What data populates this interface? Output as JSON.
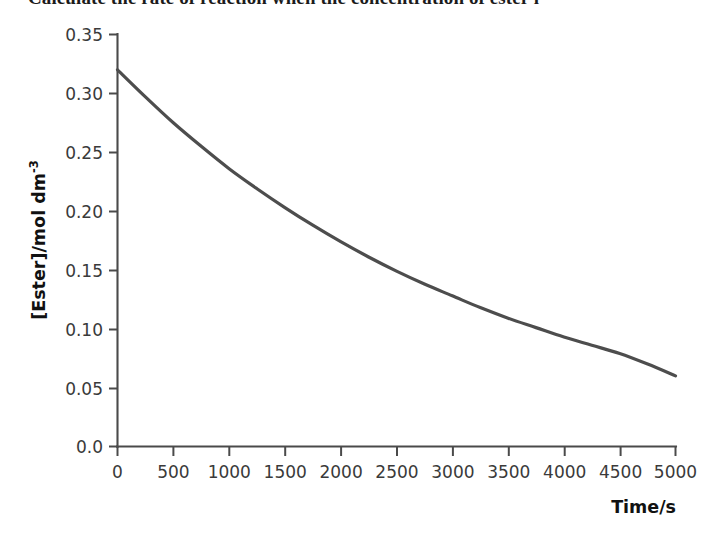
{
  "page": {
    "background_color": "#ffffff",
    "header_partial_text": "Calculate the rate of reaction when the concentration of ester i"
  },
  "chart_data": {
    "type": "line",
    "title": "",
    "subtitle": "",
    "xlabel": "Time/s",
    "ylabel": "[Ester]/mol dm⁻³",
    "ylabel_parts": {
      "base": "[Ester]/mol dm",
      "exponent": "-3"
    },
    "xlim": [
      0,
      5000
    ],
    "ylim": [
      0.0,
      0.35
    ],
    "grid": false,
    "legend": null,
    "legend_position": "none",
    "line_color": "#4d4d4d",
    "axis_color": "#4a4a4a",
    "xticks": [
      0,
      500,
      1000,
      1500,
      2000,
      2500,
      3000,
      3500,
      4000,
      4500,
      5000
    ],
    "xticklabels": [
      "0",
      "500",
      "1000",
      "1500",
      "2000",
      "2500",
      "3000",
      "3500",
      "4000",
      "4500",
      "5000"
    ],
    "yticks": [
      0.0,
      0.05,
      0.1,
      0.15,
      0.2,
      0.25,
      0.3,
      0.35
    ],
    "yticklabels": [
      "0.0",
      "0.05",
      "0.10",
      "0.15",
      "0.20",
      "0.25",
      "0.30",
      "0.35"
    ],
    "series": [
      {
        "name": "Ester concentration",
        "x": [
          0,
          250,
          500,
          750,
          1000,
          1250,
          1500,
          1750,
          2000,
          2250,
          2500,
          2750,
          3000,
          3250,
          3500,
          3750,
          4000,
          4250,
          4500,
          4750,
          5000
        ],
        "y": [
          0.32,
          0.297,
          0.275,
          0.255,
          0.236,
          0.219,
          0.203,
          0.188,
          0.174,
          0.161,
          0.149,
          0.138,
          0.128,
          0.118,
          0.109,
          0.101,
          0.093,
          0.086,
          0.079,
          0.07,
          0.06
        ]
      }
    ]
  }
}
